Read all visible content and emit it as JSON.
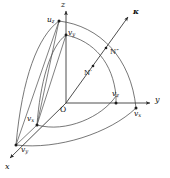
{
  "figure": {
    "kind": "3d-coordinate-octant-diagram",
    "background_color": "#ffffff",
    "ink_color": "#2b2b2b",
    "axes": [
      {
        "id": "z",
        "label": "z",
        "direction": "up"
      },
      {
        "id": "y",
        "label": "y",
        "direction": "right"
      },
      {
        "id": "x",
        "label": "x",
        "direction": "lower-left"
      }
    ],
    "vector": {
      "id": "kappa",
      "label": "κ",
      "direction": "upper-right"
    },
    "origin": {
      "id": "origin",
      "label": "O"
    },
    "points": [
      {
        "id": "uz",
        "label": "u",
        "subscript": "z"
      },
      {
        "id": "vy_top",
        "label": "v",
        "subscript": "y"
      },
      {
        "id": "vz_axis",
        "label": "v",
        "subscript": "z"
      },
      {
        "id": "vx_axis",
        "label": "v",
        "subscript": "x"
      },
      {
        "id": "vx_left",
        "label": "v",
        "subscript": "x"
      },
      {
        "id": "vy_left",
        "label": "v",
        "subscript": "y"
      },
      {
        "id": "n_prime",
        "label": "N′"
      },
      {
        "id": "n_double_prime",
        "label": "N″"
      }
    ]
  }
}
